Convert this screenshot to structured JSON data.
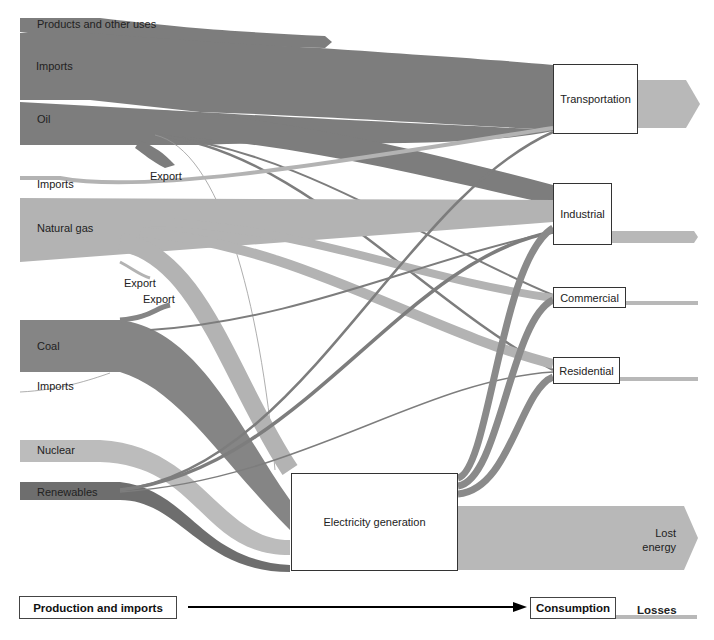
{
  "colors": {
    "oil": "#7d7d7d",
    "gas": "#b3b3b3",
    "coal": "#858585",
    "nuclear": "#bcbcbc",
    "renewables": "#6e6e6e",
    "electricity": "#8a8a8a",
    "loss": "#b8b8b8"
  },
  "sources": {
    "oil": {
      "products_label": "Products and other uses",
      "imports_label": "Imports",
      "label": "Oil",
      "export_label": "Export"
    },
    "gas": {
      "imports_label": "Imports",
      "label": "Natural gas",
      "export_label": "Export"
    },
    "coal": {
      "export_label": "Export",
      "label": "Coal",
      "imports_label": "Imports"
    },
    "nuclear": {
      "label": "Nuclear"
    },
    "renewables": {
      "label": "Renewables"
    }
  },
  "nodes": {
    "transportation": "Transportation",
    "industrial": "Industrial",
    "commercial": "Commercial",
    "residential": "Residential",
    "electricity": "Electricity generation",
    "lost_energy": "Lost energy"
  },
  "legend": {
    "production": "Production and imports",
    "consumption": "Consumption",
    "losses": "Losses"
  }
}
